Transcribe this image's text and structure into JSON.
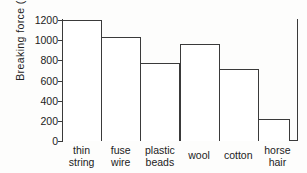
{
  "chart_data": {
    "type": "bar",
    "title": "",
    "xlabel": "",
    "ylabel": "Breaking  force  (grams)",
    "categories": [
      "thin string",
      "fuse wire",
      "plastic beads",
      "wool",
      "cotton",
      "horse hair"
    ],
    "category_lines": [
      [
        "thin",
        "string"
      ],
      [
        "fuse",
        "wire"
      ],
      [
        "plastic",
        "beads"
      ],
      [
        "wool",
        ""
      ],
      [
        "cotton",
        ""
      ],
      [
        "horse",
        "hair"
      ]
    ],
    "values": [
      1200,
      1030,
      770,
      965,
      710,
      215
    ],
    "ylim": [
      0,
      1200
    ],
    "yticks": [
      0,
      200,
      400,
      600,
      800,
      1000,
      1200
    ],
    "ytick_labels": [
      "0",
      "200",
      "400",
      "600",
      "800",
      "1000",
      "1200"
    ],
    "grid": false,
    "legend": false,
    "bar_fill": "#ffffff",
    "bar_edge": "#3a3a3a",
    "axis_color": "#3a3a3a",
    "background": "#fdfdfc"
  }
}
